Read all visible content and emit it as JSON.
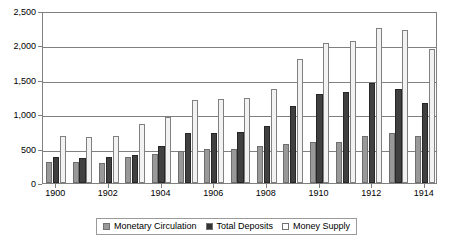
{
  "chart_data": {
    "type": "bar",
    "title": "",
    "subtitle": "",
    "xlabel": "",
    "ylabel": "",
    "ylim": [
      0,
      2500
    ],
    "ytick_values": [
      0,
      500,
      1000,
      1500,
      2000,
      2500
    ],
    "ytick_labels": [
      "0",
      "500",
      "1,000",
      "1,500",
      "2,000",
      "2,500"
    ],
    "grid": true,
    "legend_position": "bottom-center",
    "categories": [
      "1900",
      "1901",
      "1902",
      "1903",
      "1904",
      "1905",
      "1906",
      "1907",
      "1908",
      "1909",
      "1910",
      "1911",
      "1912",
      "1913",
      "1914"
    ],
    "xtick_labels_shown": [
      "1900",
      "1902",
      "1904",
      "1906",
      "1908",
      "1910",
      "1912",
      "1914"
    ],
    "series": [
      {
        "name": "Monetary Circulation",
        "color": "#999999",
        "values": [
          310,
          300,
          295,
          375,
          420,
          470,
          490,
          500,
          540,
          560,
          600,
          590,
          680,
          720,
          680
        ]
      },
      {
        "name": "Total Deposits",
        "color": "#404040",
        "values": [
          380,
          370,
          380,
          400,
          545,
          720,
          730,
          740,
          830,
          1120,
          1300,
          1330,
          1460,
          1370,
          1160
        ]
      },
      {
        "name": "Money Supply",
        "color": "#ffffff",
        "values": [
          680,
          670,
          680,
          860,
          960,
          1210,
          1220,
          1240,
          1370,
          1800,
          2030,
          2070,
          2250,
          2220,
          1950
        ]
      }
    ]
  },
  "legend": {
    "items": [
      {
        "label": "Monetary Circulation"
      },
      {
        "label": "Total Deposits"
      },
      {
        "label": "Money Supply"
      }
    ]
  }
}
